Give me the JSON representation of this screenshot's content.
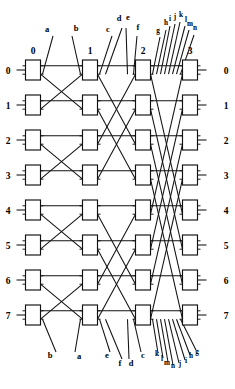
{
  "diagram": {
    "type": "interconnection-network",
    "stage_count": 4,
    "row_count": 8,
    "stage_headers": [
      "0",
      "1",
      "2",
      "3"
    ],
    "row_labels_left": [
      "0",
      "1",
      "2",
      "3",
      "4",
      "5",
      "6",
      "7"
    ],
    "row_labels_right": [
      "0",
      "1",
      "2",
      "3",
      "4",
      "5",
      "6",
      "7"
    ],
    "top_port_labels": [
      {
        "text": "a",
        "x": 47,
        "y": 32
      },
      {
        "text": "b",
        "x": 76,
        "y": 31
      },
      {
        "text": "c",
        "x": 108,
        "y": 32
      },
      {
        "text": "d",
        "x": 119,
        "y": 21
      },
      {
        "text": "e",
        "x": 128,
        "y": 20
      },
      {
        "text": "f",
        "x": 138,
        "y": 30
      },
      {
        "text": "g",
        "x": 158,
        "y": 33
      },
      {
        "text": "h",
        "x": 166,
        "y": 25
      },
      {
        "text": "i",
        "x": 170,
        "y": 21
      },
      {
        "text": "j",
        "x": 175,
        "y": 19
      },
      {
        "text": "k",
        "x": 181,
        "y": 17
      },
      {
        "text": "l",
        "x": 186,
        "y": 22
      },
      {
        "text": "m",
        "x": 190,
        "y": 26
      },
      {
        "text": "n",
        "x": 195,
        "y": 30
      }
    ],
    "bottom_port_labels": [
      {
        "text": "b",
        "x": 50,
        "y": 358
      },
      {
        "text": "a",
        "x": 79,
        "y": 359
      },
      {
        "text": "e",
        "x": 107,
        "y": 358
      },
      {
        "text": "f",
        "x": 120,
        "y": 366
      },
      {
        "text": "d",
        "x": 131,
        "y": 366
      },
      {
        "text": "c",
        "x": 143,
        "y": 358
      },
      {
        "text": "k",
        "x": 157,
        "y": 356
      },
      {
        "text": "l",
        "x": 162,
        "y": 361
      },
      {
        "text": "m",
        "x": 167,
        "y": 365
      },
      {
        "text": "n",
        "x": 173,
        "y": 368
      },
      {
        "text": "j",
        "x": 180,
        "y": 366
      },
      {
        "text": "i",
        "x": 186,
        "y": 363
      },
      {
        "text": "h",
        "x": 191,
        "y": 358
      },
      {
        "text": "g",
        "x": 197,
        "y": 354
      }
    ],
    "colors": {
      "line": "#111111",
      "box_fill": "#ffffff",
      "background": "#ffffff",
      "text": "#000000"
    },
    "geometry": {
      "stage_x": [
        33,
        90,
        143,
        190
      ],
      "box_width": 15,
      "box_height": 20,
      "row_y": [
        70,
        105,
        140,
        175,
        210,
        245,
        280,
        315
      ],
      "strides": [
        1,
        2,
        4
      ]
    }
  }
}
